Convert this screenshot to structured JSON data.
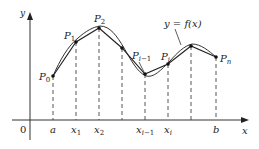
{
  "figure": {
    "axis_labels": {
      "x": "x",
      "y": "y",
      "origin": "0"
    },
    "curve_label": "y = f(x)",
    "points": [
      {
        "name": "P",
        "sub": "0",
        "px": 53,
        "py": 76
      },
      {
        "name": "P",
        "sub": "1",
        "px": 76,
        "py": 42
      },
      {
        "name": "P",
        "sub": "2",
        "px": 99,
        "py": 28
      },
      {
        "name": "",
        "sub": "",
        "px": 122,
        "py": 48
      },
      {
        "name": "P",
        "sub": "i−1",
        "px": 145,
        "py": 74
      },
      {
        "name": "P",
        "sub": "i",
        "px": 168,
        "py": 64
      },
      {
        "name": "",
        "sub": "",
        "px": 191,
        "py": 46
      },
      {
        "name": "P",
        "sub": "n",
        "px": 216,
        "py": 57
      }
    ],
    "tick_labels": [
      {
        "main": "a",
        "sub": "",
        "px": 53
      },
      {
        "main": "x",
        "sub": "1",
        "px": 76
      },
      {
        "main": "x",
        "sub": "2",
        "px": 99
      },
      {
        "main": "x",
        "sub": "i−1",
        "px": 145
      },
      {
        "main": "x",
        "sub": "i",
        "px": 168
      },
      {
        "main": "b",
        "sub": "",
        "px": 216
      }
    ]
  }
}
